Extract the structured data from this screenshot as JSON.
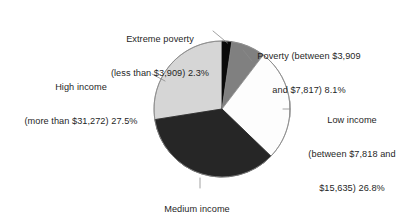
{
  "chart_data": {
    "type": "pie",
    "title": "",
    "subtitle": "",
    "xlabel": "",
    "ylabel": "",
    "grid": false,
    "legend_position": "none",
    "label_style": "outside-with-leader-lines",
    "start_angle_deg": 0,
    "direction": "clockwise",
    "units": "percent",
    "total": 100.0,
    "categories": [
      "Extreme poverty (less than $3,909)",
      "Poverty (between $3,909 and $7,817)",
      "Low income (between $7,818 and $15,635)",
      "Medium income (between $15,636 and $31,271)",
      "High income (more than $31,272)"
    ],
    "values": [
      2.3,
      8.1,
      26.8,
      35.3,
      27.5
    ],
    "slices": [
      {
        "name": "extreme-poverty",
        "category": "Extreme poverty",
        "range": "less than $3,909",
        "value": 2.3,
        "value_label": "2.3%",
        "color": "#0a0a0a",
        "start_deg": 0.0,
        "end_deg": 8.28
      },
      {
        "name": "poverty",
        "category": "Poverty",
        "range": "between $3,909 and $7,817",
        "value": 8.1,
        "value_label": "8.1%",
        "color": "#808080",
        "start_deg": 8.28,
        "end_deg": 37.44
      },
      {
        "name": "low-income",
        "category": "Low income",
        "range": "between $7,818 and $15,635",
        "value": 26.8,
        "value_label": "26.8%",
        "color": "#fdfdfd",
        "start_deg": 37.44,
        "end_deg": 133.92
      },
      {
        "name": "medium-income",
        "category": "Medium income",
        "range": "between $15,636 and $31,271",
        "value": 35.3,
        "value_label": "35.3%",
        "color": "#262626",
        "start_deg": 133.92,
        "end_deg": 261.0
      },
      {
        "name": "high-income",
        "category": "High income",
        "range": "more than $31,272",
        "value": 27.5,
        "value_label": "27.5%",
        "color": "#d6d6d6",
        "start_deg": 261.0,
        "end_deg": 360.0
      }
    ]
  },
  "labels": {
    "extreme_poverty": {
      "line1": "Extreme poverty",
      "line2": "(less than $3,909) 2.3%"
    },
    "poverty": {
      "line1": "Poverty (between $3,909",
      "line2": "and $7,817) 8.1%"
    },
    "low_income": {
      "line1": "Low income",
      "line2": "(between $7,818 and",
      "line3": "$15,635) 26.8%"
    },
    "high_income": {
      "line1": "High income",
      "line2": "(more than $31,272) 27.5%"
    },
    "medium_income": {
      "line1": "Medium income",
      "line2": "(between $15,636 and $31,271) 35.3%"
    }
  },
  "colors": {
    "background": "#ffffff",
    "text": "#1f1f1f",
    "outline": "#8a8a8a",
    "leader": "#8a8a8a",
    "slice_extreme_poverty": "#0a0a0a",
    "slice_poverty": "#808080",
    "slice_low_income": "#fdfdfd",
    "slice_medium_income": "#262626",
    "slice_high_income": "#d6d6d6"
  }
}
